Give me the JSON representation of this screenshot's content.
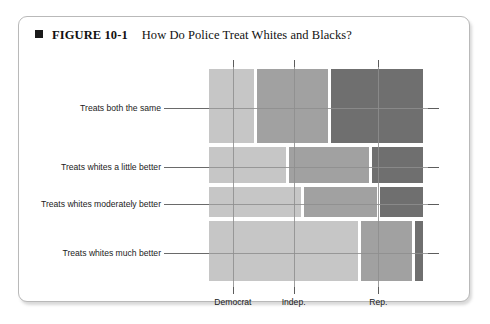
{
  "figure": {
    "marker": "square-bullet",
    "number": "FIGURE 10-1",
    "title": "How Do Police Treat Whites and Blacks?"
  },
  "colors": {
    "democrat": "#c6c6c6",
    "independent": "#a1a1a1",
    "republican": "#6f6f6f",
    "gridline": "#8e8e8e",
    "frame": "#b9b9b9",
    "text": "#1b1b1b"
  },
  "chart_data": {
    "type": "bar",
    "subtype": "mosaic",
    "title": "How Do Police Treat Whites and Blacks?",
    "xlabel": "",
    "ylabel": "",
    "grid": true,
    "legend": "none",
    "categories": [
      "Treats both the same",
      "Treats whites a little better",
      "Treats whites moderately better",
      "Treats whites much better"
    ],
    "columns": [
      "Democrat",
      "Indep.",
      "Rep."
    ],
    "row_heights_pct": [
      34.0,
      17.5,
      14.5,
      28.0
    ],
    "series": [
      {
        "name": "Democrat",
        "values": [
          22.0,
          37.0,
          44.0,
          70.0
        ]
      },
      {
        "name": "Indep.",
        "values": [
          34.0,
          38.0,
          35.0,
          25.0
        ]
      },
      {
        "name": "Rep.",
        "values": [
          44.0,
          25.0,
          21.0,
          5.0
        ]
      }
    ]
  },
  "axis": {
    "column_labels": [
      "Democrat",
      "Indep.",
      "Rep."
    ]
  }
}
